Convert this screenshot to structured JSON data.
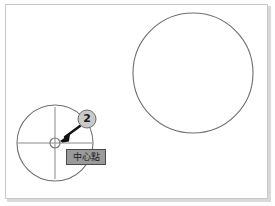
{
  "figure": {
    "title": "",
    "frame": {
      "border_color": "#c9c9c9",
      "shadow_color": "#d9d9d9",
      "background": "#ffffff"
    },
    "drawing": {
      "line_color": "#6e6e6e",
      "crosshair_color": "#8a8a8a",
      "circles": [
        {
          "name": "left-circle",
          "cx": 55,
          "cy": 143,
          "r": 38
        },
        {
          "name": "right-circle",
          "cx": 193,
          "cy": 73,
          "r": 60
        }
      ],
      "crosshair": {
        "cx": 55,
        "cy": 143,
        "h_start": 18,
        "h_end": 92,
        "v_start": 107,
        "v_end": 179,
        "marker_r": 5
      }
    },
    "annotations": {
      "step_badge": {
        "label": "2",
        "cx": 87,
        "cy": 119,
        "r": 9,
        "fill": "#c9c9c9",
        "stroke": "#6e6e6e",
        "text_color": "#1a1a1a"
      },
      "arrow": {
        "name": "pointer-arrow",
        "from_x": 79,
        "from_y": 127,
        "to_x": 62,
        "to_y": 140,
        "color": "#111111"
      },
      "tooltip": {
        "text": "中心點",
        "background": "#9a9a9a",
        "border": "#4a4a4a",
        "text_color": "#1c1c1c"
      }
    }
  }
}
